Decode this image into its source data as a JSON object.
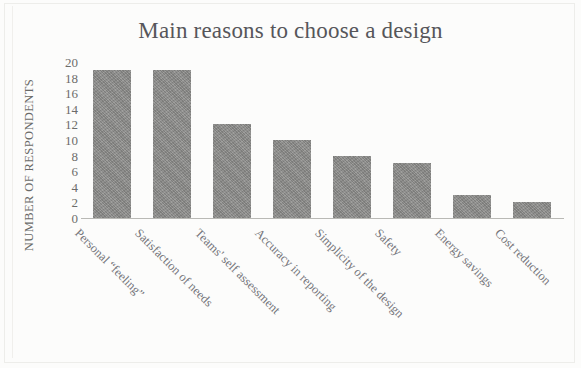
{
  "chart_data": {
    "type": "bar",
    "title": "Main reasons to choose a design",
    "xlabel": "",
    "ylabel": "NUMBER OF RESPONDENTS",
    "ylim": [
      0,
      20
    ],
    "yticks": [
      20,
      18,
      16,
      14,
      12,
      10,
      8,
      6,
      4,
      2,
      0
    ],
    "grid": false,
    "legend": null,
    "bar_color": "#8c8c8a",
    "axis_color": "#b9b9b5",
    "categories": [
      "Personal “feeling”",
      "Satisfaction of needs",
      "Teams' self assessment",
      "Accuracy in reporting",
      "Simplicity of the design",
      "Safety",
      "Energy savings",
      "Cost reduction"
    ],
    "values": [
      19,
      19,
      12,
      10,
      8,
      7,
      3,
      2
    ]
  }
}
